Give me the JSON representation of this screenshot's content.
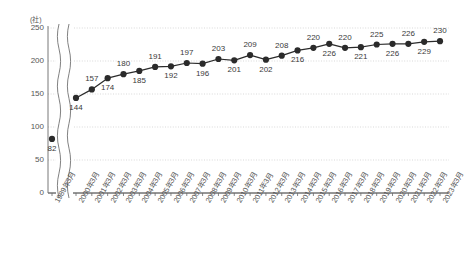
{
  "chart_data": {
    "type": "line",
    "title": "",
    "subtitle": "",
    "xlabel": "",
    "ylabel": "",
    "unit_label": "(社)",
    "ylim": [
      0,
      250
    ],
    "yticks": [
      0,
      50,
      100,
      150,
      200,
      250
    ],
    "grid": true,
    "legend": "none",
    "axis_break": true,
    "axis_break_note": "broken x-axis between 1989年3月 and 2000年3月",
    "categories": [
      "1989年3月",
      "2000年3月",
      "2001年3月",
      "2002年3月",
      "2003年3月",
      "2004年3月",
      "2005年3月",
      "2006年3月",
      "2007年3月",
      "2008年3月",
      "2009年3月",
      "2010年3月",
      "2011年3月",
      "2012年3月",
      "2013年3月",
      "2014年3月",
      "2015年3月",
      "2016年3月",
      "2017年3月",
      "2018年3月",
      "2019年3月",
      "2020年3月",
      "2021年3月",
      "2022年3月",
      "2023年3月"
    ],
    "values": [
      82,
      144,
      157,
      174,
      180,
      185,
      191,
      192,
      197,
      196,
      203,
      201,
      209,
      202,
      208,
      216,
      220,
      226,
      220,
      221,
      225,
      226,
      226,
      229,
      230
    ],
    "label_positions": [
      "below",
      "below",
      "above",
      "below",
      "above",
      "below",
      "above",
      "below",
      "above",
      "below",
      "above",
      "below",
      "above",
      "below",
      "above",
      "below",
      "above",
      "below",
      "above",
      "below",
      "above",
      "below",
      "above",
      "below",
      "above"
    ],
    "series": [
      {
        "name": "社数",
        "values": [
          82,
          144,
          157,
          174,
          180,
          185,
          191,
          192,
          197,
          196,
          203,
          201,
          209,
          202,
          208,
          216,
          220,
          226,
          220,
          221,
          225,
          226,
          226,
          229,
          230
        ]
      }
    ],
    "colors": {
      "marker": "#2b2b2b",
      "line": "#2b2b2b",
      "grid": "#c9c9c9",
      "axis": "#6a6a6a",
      "text": "#3a3a3a"
    }
  }
}
